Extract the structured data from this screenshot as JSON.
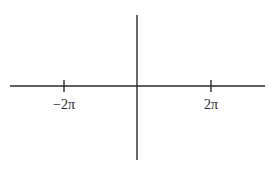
{
  "diagram": {
    "type": "coordinate-axes",
    "colors": {
      "background": "#ffffff",
      "stroke": "#2a2a2a"
    },
    "x_axis": {
      "x1": 10,
      "x2": 265,
      "y": 86
    },
    "y_axis": {
      "x": 137,
      "y1": 15,
      "y2": 160
    },
    "ticks": [
      {
        "label": "−2π",
        "x": 64,
        "y1": 80,
        "y2": 92,
        "label_y": 98
      },
      {
        "label": "2π",
        "x": 211,
        "y1": 80,
        "y2": 92,
        "label_y": 98
      }
    ]
  }
}
